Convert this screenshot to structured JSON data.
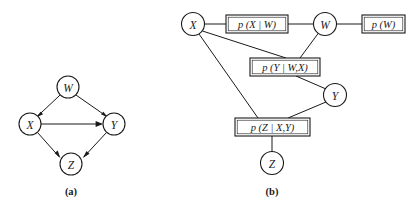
{
  "figure": {
    "type": "diagram",
    "background_color": "#ffffff",
    "ink_color": "#1a1a1a",
    "panels": [
      {
        "id": "a",
        "caption": "(a)",
        "kind": "bayesian-network",
        "caption_pos": {
          "x": 71,
          "y": 191
        },
        "nodes": [
          {
            "id": "W",
            "label": "W",
            "x": 68,
            "y": 87,
            "r": 11
          },
          {
            "id": "X",
            "label": "X",
            "x": 30,
            "y": 124,
            "r": 11
          },
          {
            "id": "Y",
            "label": "Y",
            "x": 114,
            "y": 124,
            "r": 11
          },
          {
            "id": "Z",
            "label": "Z",
            "x": 71,
            "y": 164,
            "r": 11
          }
        ],
        "edges": [
          {
            "from": "W",
            "to": "X",
            "directed": true
          },
          {
            "from": "W",
            "to": "Y",
            "directed": true
          },
          {
            "from": "X",
            "to": "Y",
            "directed": true
          },
          {
            "from": "X",
            "to": "Z",
            "directed": true
          },
          {
            "from": "Y",
            "to": "Z",
            "directed": true
          }
        ]
      },
      {
        "id": "b",
        "caption": "(b)",
        "kind": "factor-graph",
        "caption_pos": {
          "x": 272,
          "y": 191
        },
        "nodes": [
          {
            "id": "X",
            "label": "X",
            "x": 193,
            "y": 24,
            "r": 11.5
          },
          {
            "id": "W",
            "label": "W",
            "x": 325,
            "y": 24,
            "r": 11.5
          },
          {
            "id": "Y",
            "label": "Y",
            "x": 335,
            "y": 95,
            "r": 11.5
          },
          {
            "id": "Z",
            "label": "Z",
            "x": 272,
            "y": 163,
            "r": 11.5
          }
        ],
        "factors": [
          {
            "id": "fXW",
            "label": "p (X | W)",
            "x": 226,
            "y": 15,
            "w": 62,
            "h": 18
          },
          {
            "id": "fW",
            "label": "p (W)",
            "x": 362,
            "y": 15,
            "w": 43,
            "h": 18
          },
          {
            "id": "fYWX",
            "label": "p (Y | W,X)",
            "x": 250,
            "y": 58,
            "w": 70,
            "h": 18
          },
          {
            "id": "fZXY",
            "label": "p (Z | X,Y)",
            "x": 235,
            "y": 118,
            "w": 75,
            "h": 18
          }
        ],
        "edges": [
          {
            "from": "X",
            "to": "fXW",
            "directed": false
          },
          {
            "from": "fXW",
            "to": "W",
            "directed": false
          },
          {
            "from": "W",
            "to": "fW",
            "directed": false
          },
          {
            "from": "X",
            "to": "fYWX",
            "directed": false
          },
          {
            "from": "W",
            "to": "fYWX",
            "directed": false
          },
          {
            "from": "fYWX",
            "to": "Y",
            "directed": false
          },
          {
            "from": "X",
            "to": "fZXY",
            "directed": false
          },
          {
            "from": "Y",
            "to": "fZXY",
            "directed": false
          },
          {
            "from": "fZXY",
            "to": "Z",
            "directed": false
          }
        ]
      }
    ]
  }
}
